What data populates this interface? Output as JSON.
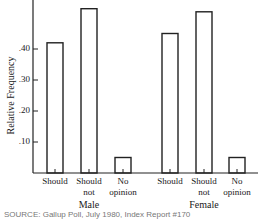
{
  "chart_data": {
    "type": "bar",
    "title": "",
    "xlabel": "",
    "ylabel": "Relative Frequency",
    "ylim": [
      0,
      0.55
    ],
    "yticks": [
      ".10",
      ".20",
      ".30",
      ".40"
    ],
    "grid": false,
    "legend": null,
    "groups": [
      {
        "name": "Male",
        "categories": [
          "Should",
          "Should not",
          "No opinion"
        ],
        "values": [
          0.42,
          0.53,
          0.05
        ]
      },
      {
        "name": "Female",
        "categories": [
          "Should",
          "Should not",
          "No opinion"
        ],
        "values": [
          0.45,
          0.52,
          0.05
        ]
      }
    ],
    "source": "SOURCE: Gallup Poll, July 1980, Index Report #170"
  },
  "labels": {
    "ylabel": "Relative Frequency",
    "ticks": [
      ".40",
      ".30",
      ".20",
      ".10"
    ],
    "male": "Male",
    "female": "Female",
    "should": "Should",
    "should_not_1": "Should",
    "should_not_2": "not",
    "no_op_1": "No",
    "no_op_2": "opinion",
    "source": "SOURCE: Gallup Poll, July 1980, Index Report #170"
  }
}
